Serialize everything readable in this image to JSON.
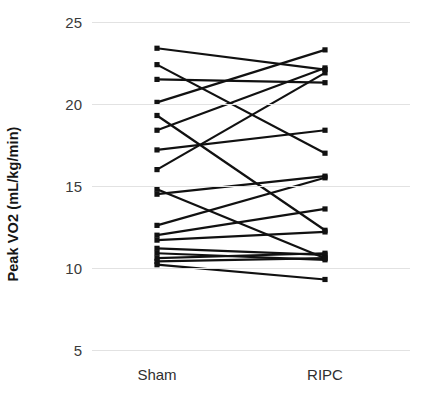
{
  "chart_data": {
    "type": "line",
    "subtype": "paired-slope-chart",
    "title": "",
    "xlabel": "",
    "ylabel": "Peak VO2 (mL/kg/min)",
    "categories": [
      "Sham",
      "RIPC"
    ],
    "ylim": [
      5,
      25
    ],
    "yticks": [
      25,
      20,
      15,
      10,
      5
    ],
    "ytick_labels": [
      "25",
      "20",
      "15",
      "10",
      "5"
    ],
    "grid": true,
    "legend": false,
    "line_color": "#111111",
    "marker_color": "#111111",
    "grid_color": "#e2e2e2",
    "series": [
      {
        "name": "subject-1",
        "values": [
          23.4,
          22.1
        ]
      },
      {
        "name": "subject-2",
        "values": [
          22.4,
          17.0
        ]
      },
      {
        "name": "subject-3",
        "values": [
          21.5,
          21.3
        ]
      },
      {
        "name": "subject-4",
        "values": [
          20.1,
          23.3
        ]
      },
      {
        "name": "subject-5",
        "values": [
          19.3,
          12.3
        ]
      },
      {
        "name": "subject-6",
        "values": [
          18.4,
          22.2
        ]
      },
      {
        "name": "subject-7",
        "values": [
          17.2,
          18.4
        ]
      },
      {
        "name": "subject-8",
        "values": [
          16.0,
          21.9
        ]
      },
      {
        "name": "subject-9",
        "values": [
          14.8,
          10.6
        ]
      },
      {
        "name": "subject-10",
        "values": [
          14.5,
          15.6
        ]
      },
      {
        "name": "subject-11",
        "values": [
          12.6,
          15.5
        ]
      },
      {
        "name": "subject-12",
        "values": [
          12.0,
          13.6
        ]
      },
      {
        "name": "subject-13",
        "values": [
          11.7,
          12.2
        ]
      },
      {
        "name": "subject-14",
        "values": [
          11.2,
          10.8
        ]
      },
      {
        "name": "subject-15",
        "values": [
          10.9,
          10.5
        ]
      },
      {
        "name": "subject-16",
        "values": [
          10.6,
          10.9
        ]
      },
      {
        "name": "subject-17",
        "values": [
          10.4,
          10.6
        ]
      },
      {
        "name": "subject-18",
        "values": [
          10.2,
          9.3
        ]
      }
    ]
  }
}
